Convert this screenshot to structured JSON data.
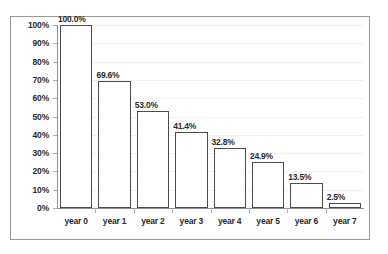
{
  "chart_data": {
    "type": "bar",
    "title": "",
    "subtitle": "",
    "xlabel": "",
    "ylabel": "",
    "categories": [
      "year 0",
      "year 1",
      "year 2",
      "year 3",
      "year 4",
      "year 5",
      "year 6",
      "year 7"
    ],
    "values": [
      100.0,
      69.6,
      53.0,
      41.4,
      32.8,
      24.9,
      13.5,
      2.5
    ],
    "data_labels": [
      "100.0%",
      "69.6%",
      "53.0%",
      "41.4%",
      "32.8%",
      "24.9%",
      "13.5%",
      "2.5%"
    ],
    "ylim": [
      0,
      100
    ],
    "ytick_values": [
      0,
      10,
      20,
      30,
      40,
      50,
      60,
      70,
      80,
      90,
      100
    ],
    "ytick_labels": [
      "0%",
      "10%",
      "20%",
      "30%",
      "40%",
      "50%",
      "60%",
      "70%",
      "80%",
      "90%",
      "100%"
    ],
    "grid": true,
    "grid_orientation": "horizontal",
    "legend": false,
    "legend_position": "none",
    "series": [
      {
        "name": "",
        "values": [
          100.0,
          69.6,
          53.0,
          41.4,
          32.8,
          24.9,
          13.5,
          2.5
        ]
      }
    ]
  },
  "style": {
    "bar_fill": "#ffffff",
    "bar_border": "#4a4a4a",
    "axis_color": "#8d8d8d",
    "gridline_color": "#f1f1f1",
    "frame_color": "#9a9a9a",
    "text_color": "#2b2b2b",
    "background": "#ffffff"
  }
}
